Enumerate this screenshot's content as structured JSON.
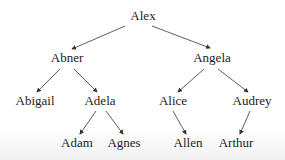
{
  "tree": {
    "nodes": [
      {
        "id": "alex",
        "label": "Alex",
        "x": 143,
        "y": 16
      },
      {
        "id": "abner",
        "label": "Abner",
        "x": 67,
        "y": 58
      },
      {
        "id": "angela",
        "label": "Angela",
        "x": 212,
        "y": 58
      },
      {
        "id": "abigail",
        "label": "Abigail",
        "x": 35,
        "y": 101
      },
      {
        "id": "adela",
        "label": "Adela",
        "x": 100,
        "y": 101
      },
      {
        "id": "alice",
        "label": "Alice",
        "x": 173,
        "y": 101
      },
      {
        "id": "audrey",
        "label": "Audrey",
        "x": 252,
        "y": 101
      },
      {
        "id": "adam",
        "label": "Adam",
        "x": 77,
        "y": 143
      },
      {
        "id": "agnes",
        "label": "Agnes",
        "x": 124,
        "y": 143
      },
      {
        "id": "allen",
        "label": "Allen",
        "x": 188,
        "y": 143
      },
      {
        "id": "arthur",
        "label": "Arthur",
        "x": 236,
        "y": 143
      }
    ],
    "edges": [
      {
        "from": "alex",
        "to": "abner"
      },
      {
        "from": "alex",
        "to": "angela"
      },
      {
        "from": "abner",
        "to": "abigail"
      },
      {
        "from": "abner",
        "to": "adela"
      },
      {
        "from": "angela",
        "to": "alice"
      },
      {
        "from": "angela",
        "to": "audrey"
      },
      {
        "from": "adela",
        "to": "adam"
      },
      {
        "from": "adela",
        "to": "agnes"
      },
      {
        "from": "alice",
        "to": "allen"
      },
      {
        "from": "audrey",
        "to": "arthur"
      }
    ]
  }
}
